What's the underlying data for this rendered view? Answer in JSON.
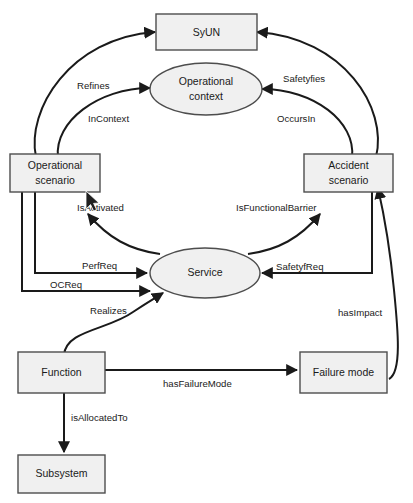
{
  "diagram": {
    "background_color": "#ffffff",
    "node_fill_color": "#f0f0f0",
    "node_stroke_color": "#4d4d4d",
    "edge_color": "#1a1a1a",
    "nodes": [
      {
        "id": "syun",
        "label": "SyUN",
        "shape": "rectangle"
      },
      {
        "id": "operational_context",
        "label": "Operational\ncontext",
        "line1": "Operational",
        "line2": "context",
        "shape": "ellipse"
      },
      {
        "id": "operational_scenario",
        "label": "Operational\nscenario",
        "line1": "Operational",
        "line2": "scenario",
        "shape": "rectangle"
      },
      {
        "id": "accident_scenario",
        "label": "Accident\nscenario",
        "line1": "Accident",
        "line2": "scenario",
        "shape": "rectangle"
      },
      {
        "id": "service",
        "label": "Service",
        "shape": "ellipse"
      },
      {
        "id": "function",
        "label": "Function",
        "shape": "rectangle"
      },
      {
        "id": "failure_mode",
        "label": "Failure mode",
        "shape": "rectangle"
      },
      {
        "id": "subsystem",
        "label": "Subsystem",
        "shape": "rectangle"
      }
    ],
    "edges": [
      {
        "id": "refines",
        "label": "Refines",
        "from": "operational_scenario",
        "to": "syun"
      },
      {
        "id": "safetyfies",
        "label": "Safetyfies",
        "from": "accident_scenario",
        "to": "syun"
      },
      {
        "id": "incontext",
        "label": "InContext",
        "from": "operational_scenario",
        "to": "operational_context"
      },
      {
        "id": "occursin",
        "label": "OccursIn",
        "from": "accident_scenario",
        "to": "operational_context"
      },
      {
        "id": "isactivated",
        "label": "IsActivated",
        "from": "service",
        "to": "operational_scenario"
      },
      {
        "id": "isfunctionalbarrier",
        "label": "IsFunctionalBarrier",
        "from": "service",
        "to": "accident_scenario"
      },
      {
        "id": "perfreq",
        "label": "PerfReq",
        "from": "operational_scenario",
        "to": "service"
      },
      {
        "id": "ocreq",
        "label": "OCReq",
        "from": "operational_scenario",
        "to": "service"
      },
      {
        "id": "safetyfreq",
        "label": "SafetyfReq",
        "from": "accident_scenario",
        "to": "service"
      },
      {
        "id": "realizes",
        "label": "Realizes",
        "from": "function",
        "to": "service"
      },
      {
        "id": "hasfailuremode",
        "label": "hasFailureMode",
        "from": "function",
        "to": "failure_mode"
      },
      {
        "id": "isallocatedto",
        "label": "isAllocatedTo",
        "from": "function",
        "to": "subsystem"
      },
      {
        "id": "hasimpact",
        "label": "hasImpact",
        "from": "failure_mode",
        "to": "accident_scenario"
      }
    ]
  }
}
